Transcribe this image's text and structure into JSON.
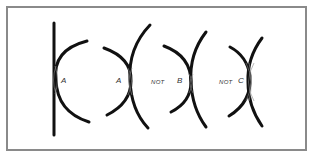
{
  "figures": [
    {
      "id": "fig1",
      "label": "A",
      "description": "plane surface in contact with convex curve"
    },
    {
      "id": "fig2",
      "label": "A",
      "description": "two opposing convex curves in contact"
    },
    {
      "id": "fig3",
      "prefix": "NOT",
      "label": "B",
      "description": "two opposing curves touching at a narrow point"
    },
    {
      "id": "fig4",
      "prefix": "NOT",
      "label": "C",
      "description": "two opposing curves with a wider contact zone"
    }
  ],
  "colors": {
    "stroke": "#111111",
    "frame": "#8a8a8a",
    "contact": "#777777",
    "background": "#ffffff"
  }
}
